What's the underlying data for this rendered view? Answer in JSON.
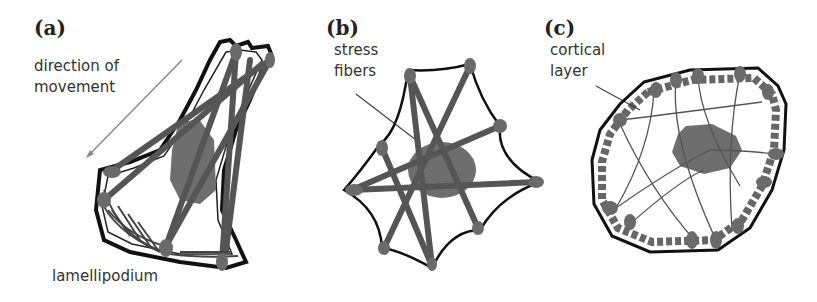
{
  "figure": {
    "panels": [
      {
        "id": "a",
        "label": "(a)",
        "annotations": {
          "direction": "direction of",
          "direction_line2": "movement",
          "lamellipodium": "lamellipodium"
        },
        "description": "migrating cell with lamellipodium and stress fibers"
      },
      {
        "id": "b",
        "label": "(b)",
        "annotations": {
          "stress_fibers": "stress",
          "stress_fibers_line2": "fibers"
        },
        "description": "spread cell with crossing stress fibers"
      },
      {
        "id": "c",
        "label": "(c)",
        "annotations": {
          "cortical_layer": "cortical",
          "cortical_layer_line2": "layer"
        },
        "description": "rounded cell with cortical actin layer"
      }
    ],
    "colors": {
      "outline": "#111111",
      "fiber": "#555555",
      "nucleus": "#6e6e6e",
      "focal_adhesion": "#6a6a6a",
      "arrow": "#8a8a8a",
      "text": "#333333"
    }
  }
}
